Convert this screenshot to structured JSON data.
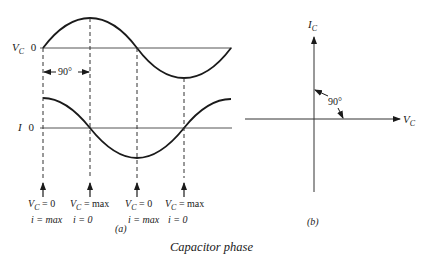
{
  "panel_a": {
    "label": "(a)",
    "vc_axis": {
      "symbol": "V",
      "sub": "C",
      "zero": "0"
    },
    "i_axis": {
      "symbol": "I",
      "zero": "0"
    },
    "phase_marker": "90°",
    "notes": [
      {
        "line1_sym": "V",
        "line1_sub": "C",
        "line1_rest": " = 0",
        "line2": "i = max"
      },
      {
        "line1_sym": "V",
        "line1_sub": "C",
        "line1_rest": " = max",
        "line2": "i = 0"
      },
      {
        "line1_sym": "V",
        "line1_sub": "C",
        "line1_rest": " = 0",
        "line2": "i = max"
      },
      {
        "line1_sym": "V",
        "line1_sub": "C",
        "line1_rest": " = max",
        "line2": "i = 0"
      }
    ]
  },
  "panel_b": {
    "label": "(b)",
    "vertical_axis": {
      "symbol": "I",
      "sub": "C"
    },
    "horizontal_axis": {
      "symbol": "V",
      "sub": "C"
    },
    "angle": "90°"
  },
  "caption": "Capacitor phase",
  "colors": {
    "ink": "#1a1a1a",
    "axis": "#555555",
    "background": "#ffffff"
  }
}
